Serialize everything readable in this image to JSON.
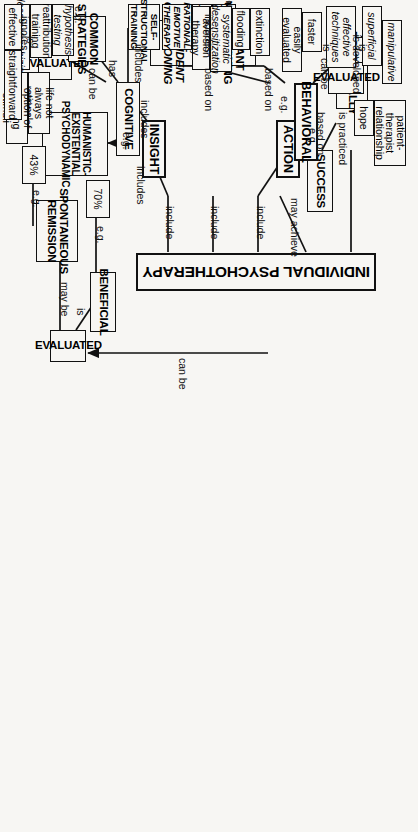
{
  "style": {
    "background": "#f7f6f3",
    "line": "#111111",
    "text": "#000000"
  },
  "nodes": {
    "individual_psychotherapy": "INDIVIDUAL PSYCHOTHERAPY",
    "eclectically": "ECLECTICALLY",
    "success": "SUCCESS",
    "action": "ACTION",
    "insight": "INSIGHT",
    "behavioral": "BEHAVIORAL",
    "cognitive": "COGNITIVE",
    "humanistic": "HUMANISTIC-EXISTENTIAL PSYCHODYNAMIC",
    "evaluated_top": "EVALUATED",
    "evaluated_mid": "EVALUATED",
    "evaluated_right": "EVALUATED",
    "operant_conditioning": "OPERANT CONDITIONING",
    "respondent_conditioning": "RESPONDENT CONDITIONING",
    "common_strategies": "COMMON STRATEGIES",
    "self_instructional": "SELF-INSTRUCTIONAL TRAINING",
    "rational_emotive": "RATIONAL-EMOTIVE THERAPY",
    "becks_therapy": "BECK'S THERAPY",
    "constructivist": "CONSTRUCTIVIST THERAPY",
    "beneficial": "BENEFICIAL",
    "spontaneous_remission": "SPONTANEOUS REMISSION",
    "pct_70": "70%",
    "pct_43": "43%",
    "patient_therapist": "patient-therapist relationship",
    "hope": "hope",
    "manipulative": "manipulative",
    "superficial": "superficial",
    "effective_techniques": "effective techniques",
    "faster": "faster",
    "easily_evaluated": "easily evaluated",
    "extinction": "extinction",
    "flooding": "flooding",
    "systematic_desensitization": "systematic desensitization",
    "aversion_therapy": "aversion therapy",
    "hypothesis_testing": "hypothesis testing",
    "reattribution_training": "reattribution training",
    "decatastrophizing": "decatastrophizing",
    "effective": "effective",
    "straightforward": "straightforward",
    "life_not_rational": "life not always rational",
    "option_changing": "option of changing stimuli"
  },
  "link_labels": {
    "is_practiced": "is practiced",
    "may_achieve": "may achieve",
    "based_on_success": "based on",
    "include_1": "include",
    "include_2": "include",
    "include_3": "include",
    "eg_action": "e.g.",
    "eg_insight": "e.g.",
    "includes_insight": "includes",
    "includes_cognitive_1": "includes",
    "includes_cognitive_2": "includes",
    "includes_behavioral": "includes",
    "can_be_behavioral": "can be",
    "based_on_1": "based on",
    "based_on_2": "based on",
    "eg_behavioral": "e.g.",
    "is_developed": "is developed",
    "is_1": "is",
    "is_2": "is",
    "has": "has",
    "can_be_cognitive": "can be",
    "eg_common": "e.g.",
    "ignores": "ignores",
    "is_effective": "is",
    "can_be_right": "can be",
    "is_beneficial": "is",
    "may_be": "may be",
    "eg_70": "e.g.",
    "eg_43": "e.g."
  }
}
